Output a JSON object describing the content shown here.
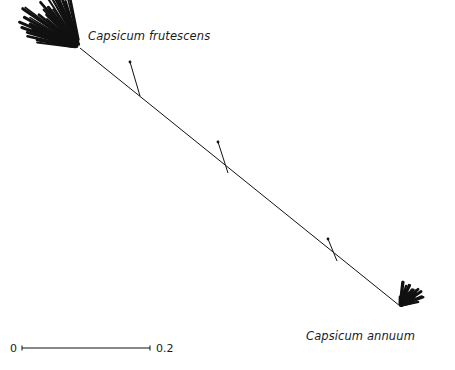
{
  "figure": {
    "kind": "phylogenetic-tree",
    "background_color": "#ffffff",
    "line_color": "#111111",
    "width": 455,
    "height": 370
  },
  "labels": {
    "frutescens": "Capsicum frutescens",
    "annuum": "Capsicum annuum"
  },
  "scale_bar": {
    "min_label": "0",
    "max_label": "0.2",
    "x_start": 22,
    "x_end": 150,
    "y": 348
  },
  "chart_data": {
    "type": "tree",
    "title": "",
    "xlabel": "",
    "ylabel": "",
    "scale_bar_units": 0.2,
    "scale_bar_pixels": 128,
    "clades": [
      {
        "name": "Capsicum frutescens",
        "label": "Capsicum frutescens",
        "node_x": 80,
        "node_y": 48,
        "tip_count": 28,
        "fan_start_angle_deg": 188,
        "fan_end_angle_deg": 258,
        "tip_radius_min": 42,
        "tip_radius_max": 72,
        "style": "dense-fan"
      },
      {
        "name": "Capsicum annuum",
        "label": "Capsicum annuum",
        "node_x": 400,
        "node_y": 306,
        "tip_count": 26,
        "fan_start_angle_deg": 272,
        "fan_end_angle_deg": 348,
        "tip_radius_min": 9,
        "tip_radius_max": 26,
        "style": "dense-fan"
      }
    ],
    "internal_branch": {
      "x1": 80,
      "y1": 48,
      "x2": 400,
      "y2": 306
    },
    "branch_stubs": [
      {
        "x1": 140,
        "y1": 96,
        "x2": 130,
        "y2": 62
      },
      {
        "x1": 228,
        "y1": 173,
        "x2": 218,
        "y2": 142
      },
      {
        "x1": 337,
        "y1": 261,
        "x2": 328,
        "y2": 239
      }
    ]
  }
}
